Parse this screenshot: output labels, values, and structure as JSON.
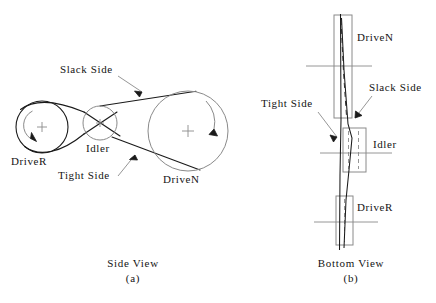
{
  "figure": {
    "background_color": "#ffffff",
    "line_color": "#1a1a1a",
    "light_line_color": "#8a8a8a",
    "text_color": "#141414"
  },
  "side_view": {
    "caption": "Side View",
    "sub_caption": "(a)",
    "pulleys": [
      {
        "name": "DriveR",
        "label": "DriveR",
        "cx": 42,
        "cy": 127,
        "r": 26,
        "rotation": "counterclockwise"
      },
      {
        "name": "Idler",
        "label": "Idler",
        "cx": 100,
        "cy": 123,
        "r": 17,
        "rotation": "none"
      },
      {
        "name": "DriveN",
        "label": "DriveN",
        "cx": 188,
        "cy": 131,
        "r": 40,
        "rotation": "clockwise"
      }
    ],
    "annotations": [
      {
        "name": "slack-side",
        "label": "Slack  Side",
        "x": 60,
        "y": 68
      },
      {
        "name": "tight-side",
        "label": "Tight  Side",
        "x": 58,
        "y": 174
      }
    ],
    "pulley_labels": [
      {
        "name": "driver-label",
        "label": "DriveR",
        "x": 12,
        "y": 160
      },
      {
        "name": "idler-label",
        "label": "Idler",
        "x": 86,
        "y": 147
      },
      {
        "name": "driven-label",
        "label": "DriveN",
        "x": 163,
        "y": 178
      }
    ]
  },
  "bottom_view": {
    "caption": "Bottom View",
    "sub_caption": "(b)",
    "pulleys": [
      {
        "name": "DriveN",
        "label": "DriveN",
        "x": 334,
        "y": 15,
        "w": 18,
        "h": 103
      },
      {
        "name": "Idler",
        "label": "Idler",
        "x": 343,
        "y": 128,
        "w": 23,
        "h": 44
      },
      {
        "name": "DriveR",
        "label": "DriveR",
        "x": 336,
        "y": 196,
        "w": 17,
        "h": 49
      }
    ],
    "annotations": [
      {
        "name": "slack-side",
        "label": "Slack  Side",
        "x": 370,
        "y": 86
      },
      {
        "name": "tight-side",
        "label": "Tight  Side",
        "x": 262,
        "y": 102
      }
    ],
    "pulley_labels": [
      {
        "name": "driven-label",
        "label": "DriveN",
        "x": 357,
        "y": 36
      },
      {
        "name": "idler-label",
        "label": "Idler",
        "x": 373,
        "y": 143
      },
      {
        "name": "driver-label",
        "label": "DriveR",
        "x": 357,
        "y": 206
      }
    ]
  }
}
